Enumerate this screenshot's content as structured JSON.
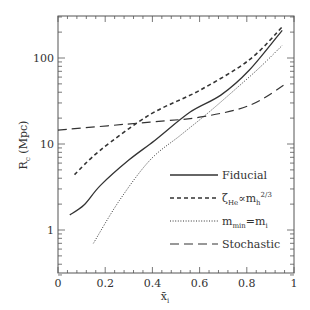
{
  "chart_data": {
    "type": "line",
    "title": "",
    "xlabel": "x̄_i",
    "ylabel": "R_c (Mpc)",
    "xlim": [
      0,
      1
    ],
    "ylim": [
      0.3,
      300
    ],
    "yscale": "log",
    "grid": false,
    "legend_position": "lower right (inside)",
    "x_ticks": [
      "0",
      "0.2",
      "0.4",
      "0.6",
      "0.8",
      "1"
    ],
    "y_ticks": [
      "1",
      "10",
      "100"
    ],
    "series": [
      {
        "name": "Fiducial",
        "style": "solid",
        "x": [
          0.05,
          0.11,
          0.18,
          0.3,
          0.41,
          0.56,
          0.69,
          0.81,
          0.95
        ],
        "y": [
          1.5,
          1.95,
          3.3,
          6.5,
          11,
          23.5,
          37,
          72,
          210
        ]
      },
      {
        "name": "ζ_He ∝ m_h^{2/3}",
        "style": "dashed",
        "x": [
          0.07,
          0.18,
          0.39,
          0.6,
          0.81,
          0.95
        ],
        "y": [
          4.4,
          8.5,
          22,
          42,
          95,
          230
        ]
      },
      {
        "name": "m_min = m_i",
        "style": "dotted",
        "x": [
          0.15,
          0.26,
          0.39,
          0.52,
          0.64,
          0.77,
          0.86,
          0.95
        ],
        "y": [
          0.7,
          2.2,
          6.5,
          12.7,
          23.5,
          48,
          80,
          140
        ]
      },
      {
        "name": "Stochastic",
        "style": "long-dashed",
        "x": [
          0.0,
          0.39,
          0.6,
          0.81,
          0.97
        ],
        "y": [
          14.5,
          18,
          20.5,
          28,
          51
        ]
      }
    ]
  },
  "axes": {
    "xlabel_main": "x̄",
    "xlabel_sub": "i",
    "ylabel_main": "R",
    "ylabel_sub": "c",
    "ylabel_unit": "(Mpc)"
  },
  "legend": [
    {
      "label": "Fiducial",
      "style": "solid"
    },
    {
      "label": "ζ_He∝m_h^2/3",
      "style": "dashed"
    },
    {
      "label": "m_min=m_i",
      "style": "dotted"
    },
    {
      "label": "Stochastic",
      "style": "long-dashed"
    }
  ]
}
